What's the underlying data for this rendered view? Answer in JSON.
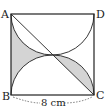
{
  "figure": {
    "type": "geometry-square-with-semicircles",
    "vertices": {
      "top_left": "A",
      "top_right": "D",
      "bottom_left": "B",
      "bottom_right": "C"
    },
    "dimension_label": "8 cm",
    "colors": {
      "stroke": "#222222",
      "shade": "#d4d4d4",
      "background": "#ffffff"
    }
  }
}
